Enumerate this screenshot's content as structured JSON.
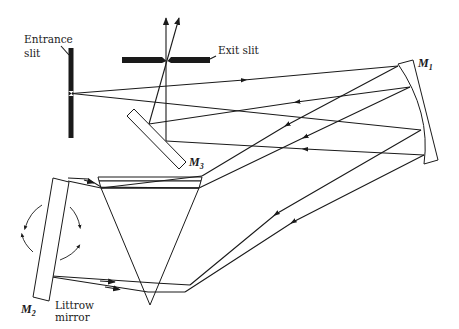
{
  "diagram": {
    "labels": {
      "entrance_slit_line1": "Entrance",
      "entrance_slit_line2": "slit",
      "exit_slit": "Exit slit",
      "m1": "M",
      "m1_sub": "1",
      "m2": "M",
      "m2_sub": "2",
      "m3": "M",
      "m3_sub": "3",
      "littrow_line1": "Littrow",
      "littrow_line2": "mirror"
    },
    "components": [
      {
        "id": "entrance-slit",
        "type": "slit",
        "orientation": "vertical"
      },
      {
        "id": "exit-slit",
        "type": "slit",
        "orientation": "horizontal"
      },
      {
        "id": "M1",
        "type": "concave-mirror"
      },
      {
        "id": "M2",
        "type": "littrow-mirror",
        "rotatable": true
      },
      {
        "id": "M3",
        "type": "plane-mirror"
      },
      {
        "id": "prism",
        "type": "triangular-prism"
      }
    ],
    "colors": {
      "ink": "#1a1a1a",
      "background": "#ffffff"
    }
  }
}
